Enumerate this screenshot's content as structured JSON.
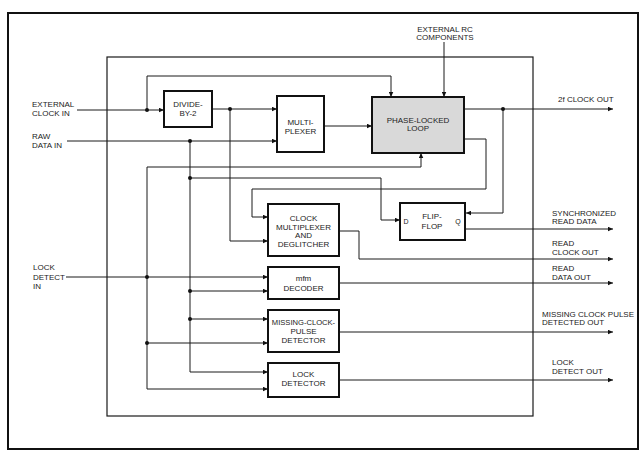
{
  "diagram": {
    "top_input": {
      "lines": [
        "EXTERNAL RC",
        "COMPONENTS"
      ]
    },
    "inputs": [
      {
        "id": "external-clock-in",
        "lines": [
          "EXTERNAL",
          "CLOCK IN"
        ]
      },
      {
        "id": "raw-data-in",
        "lines": [
          "RAW",
          "DATA IN"
        ]
      },
      {
        "id": "lock-detect-in",
        "lines": [
          "LOCK",
          "DETECT",
          "IN"
        ]
      }
    ],
    "blocks": [
      {
        "id": "divide-by-2",
        "lines": [
          "DIVIDE-",
          "BY-2"
        ]
      },
      {
        "id": "multiplexer",
        "lines": [
          "MULTI-",
          "PLEXER"
        ]
      },
      {
        "id": "phase-locked-loop",
        "lines": [
          "PHASE-LOCKED",
          "LOOP"
        ],
        "shaded": true
      },
      {
        "id": "clock-multiplexer-and-deglitcher",
        "lines": [
          "CLOCK",
          "MULTIPLEXER",
          "AND",
          "DEGLITCHER"
        ]
      },
      {
        "id": "flip-flop",
        "lines": [
          "FLIP-",
          "FLOP"
        ],
        "pins": {
          "input": "D",
          "output": "Q"
        }
      },
      {
        "id": "mfm-decoder",
        "lines": [
          "mfm",
          "DECODER"
        ]
      },
      {
        "id": "missing-clock-pulse-detector",
        "lines": [
          "MISSING-CLOCK-",
          "PULSE",
          "DETECTOR"
        ]
      },
      {
        "id": "lock-detector",
        "lines": [
          "LOCK",
          "DETECTOR"
        ]
      }
    ],
    "outputs": [
      {
        "id": "2f-clock-out",
        "lines": [
          "2f CLOCK OUT"
        ]
      },
      {
        "id": "synchronized-read-data",
        "lines": [
          "SYNCHRONIZED",
          "READ DATA"
        ]
      },
      {
        "id": "read-clock-out",
        "lines": [
          "READ",
          "CLOCK OUT"
        ]
      },
      {
        "id": "read-data-out",
        "lines": [
          "READ",
          "DATA OUT"
        ]
      },
      {
        "id": "missing-clock-pulse-detected-out",
        "lines": [
          "MISSING CLOCK PULSE",
          "DETECTED OUT"
        ]
      },
      {
        "id": "lock-detect-out",
        "lines": [
          "LOCK",
          "DETECT OUT"
        ]
      }
    ],
    "connections": [
      {
        "from": "EXTERNAL CLOCK IN",
        "to": [
          "DIVIDE-BY-2",
          "PHASE-LOCKED LOOP"
        ]
      },
      {
        "from": "DIVIDE-BY-2",
        "to": [
          "MULTIPLEXER",
          "CLOCK MULTIPLEXER AND DEGLITCHER"
        ]
      },
      {
        "from": "RAW DATA IN",
        "to": [
          "MULTIPLEXER",
          "FLIP-FLOP",
          "mfm DECODER",
          "MISSING-CLOCK-PULSE DETECTOR",
          "LOCK DETECTOR"
        ]
      },
      {
        "from": "MULTIPLEXER",
        "to": [
          "PHASE-LOCKED LOOP"
        ]
      },
      {
        "from": "EXTERNAL RC COMPONENTS",
        "to": [
          "PHASE-LOCKED LOOP"
        ]
      },
      {
        "from": "PHASE-LOCKED LOOP",
        "to": [
          "2f CLOCK OUT",
          "FLIP-FLOP",
          "CLOCK MULTIPLEXER AND DEGLITCHER"
        ]
      },
      {
        "from": "LOCK DETECT IN",
        "to": [
          "PHASE-LOCKED LOOP",
          "mfm DECODER",
          "MISSING-CLOCK-PULSE DETECTOR",
          "LOCK DETECTOR"
        ]
      },
      {
        "from": "FLIP-FLOP",
        "to": [
          "SYNCHRONIZED READ DATA"
        ]
      },
      {
        "from": "CLOCK MULTIPLEXER AND DEGLITCHER",
        "to": [
          "READ CLOCK OUT"
        ]
      },
      {
        "from": "mfm DECODER",
        "to": [
          "READ DATA OUT"
        ]
      },
      {
        "from": "MISSING-CLOCK-PULSE DETECTOR",
        "to": [
          "MISSING CLOCK PULSE DETECTED OUT"
        ]
      },
      {
        "from": "LOCK DETECTOR",
        "to": [
          "LOCK DETECT OUT"
        ]
      }
    ]
  },
  "colors": {
    "background": "#ffffff",
    "line": "#1a1a1a",
    "pll_fill": "#d9d9d9",
    "text": "#222222"
  }
}
